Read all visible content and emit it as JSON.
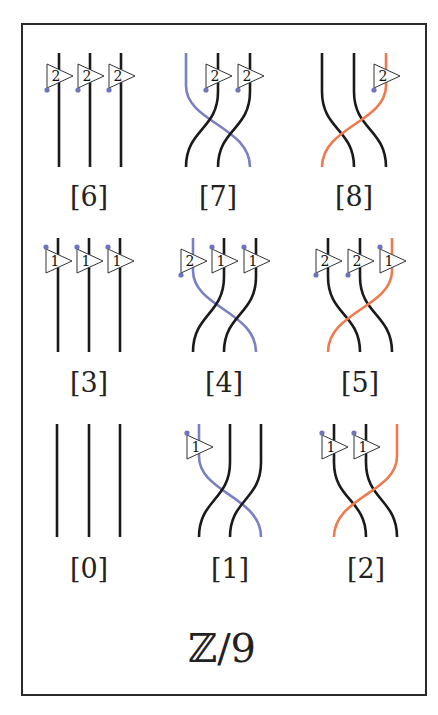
{
  "title": "ℤ/9",
  "colors": {
    "strand": "#1a1a1a",
    "blue": "#7b80c2",
    "orange": "#ef7a4f",
    "dot": "#6f74bd"
  },
  "diagrams": [
    {
      "id": 6,
      "caption": "[6]",
      "row": 0,
      "col": 0,
      "permutation": "identity",
      "colored_strand": null,
      "colored_color": null,
      "boxes": [
        {
          "strand": 0,
          "label": "2",
          "dot": "bottom"
        },
        {
          "strand": 1,
          "label": "2",
          "dot": "bottom"
        },
        {
          "strand": 2,
          "label": "2",
          "dot": "bottom"
        }
      ]
    },
    {
      "id": 7,
      "caption": "[7]",
      "row": 0,
      "col": 1,
      "permutation": "cycle-left-to-right",
      "colored_strand": 0,
      "colored_color": "blue",
      "boxes": [
        {
          "strand": 1,
          "label": "2",
          "dot": "bottom"
        },
        {
          "strand": 2,
          "label": "2",
          "dot": "bottom"
        }
      ]
    },
    {
      "id": 8,
      "caption": "[8]",
      "row": 0,
      "col": 2,
      "permutation": "cycle-right-to-left",
      "colored_strand": 2,
      "colored_color": "orange",
      "boxes": [
        {
          "strand": 2,
          "label": "2",
          "dot": "bottom"
        }
      ]
    },
    {
      "id": 3,
      "caption": "[3]",
      "row": 1,
      "col": 0,
      "permutation": "identity",
      "colored_strand": null,
      "colored_color": null,
      "boxes": [
        {
          "strand": 0,
          "label": "1",
          "dot": "top"
        },
        {
          "strand": 1,
          "label": "1",
          "dot": "top"
        },
        {
          "strand": 2,
          "label": "1",
          "dot": "top"
        }
      ]
    },
    {
      "id": 4,
      "caption": "[4]",
      "row": 1,
      "col": 1,
      "permutation": "cycle-left-to-right",
      "colored_strand": 0,
      "colored_color": "blue",
      "boxes": [
        {
          "strand": 0,
          "label": "2",
          "dot": "bottom"
        },
        {
          "strand": 1,
          "label": "1",
          "dot": "top"
        },
        {
          "strand": 2,
          "label": "1",
          "dot": "top"
        }
      ]
    },
    {
      "id": 5,
      "caption": "[5]",
      "row": 1,
      "col": 2,
      "permutation": "cycle-right-to-left",
      "colored_strand": 2,
      "colored_color": "orange",
      "boxes": [
        {
          "strand": 0,
          "label": "2",
          "dot": "bottom"
        },
        {
          "strand": 1,
          "label": "2",
          "dot": "bottom"
        },
        {
          "strand": 2,
          "label": "1",
          "dot": "top"
        }
      ]
    },
    {
      "id": 0,
      "caption": "[0]",
      "row": 2,
      "col": 0,
      "permutation": "identity",
      "colored_strand": null,
      "colored_color": null,
      "boxes": []
    },
    {
      "id": 1,
      "caption": "[1]",
      "row": 2,
      "col": 1,
      "permutation": "cycle-left-to-right",
      "colored_strand": 0,
      "colored_color": "blue",
      "boxes": [
        {
          "strand": 0,
          "label": "1",
          "dot": "top"
        }
      ]
    },
    {
      "id": 2,
      "caption": "[2]",
      "row": 2,
      "col": 2,
      "permutation": "cycle-right-to-left",
      "colored_strand": 2,
      "colored_color": "orange",
      "boxes": [
        {
          "strand": 0,
          "label": "1",
          "dot": "top"
        },
        {
          "strand": 1,
          "label": "1",
          "dot": "top"
        }
      ]
    }
  ]
}
